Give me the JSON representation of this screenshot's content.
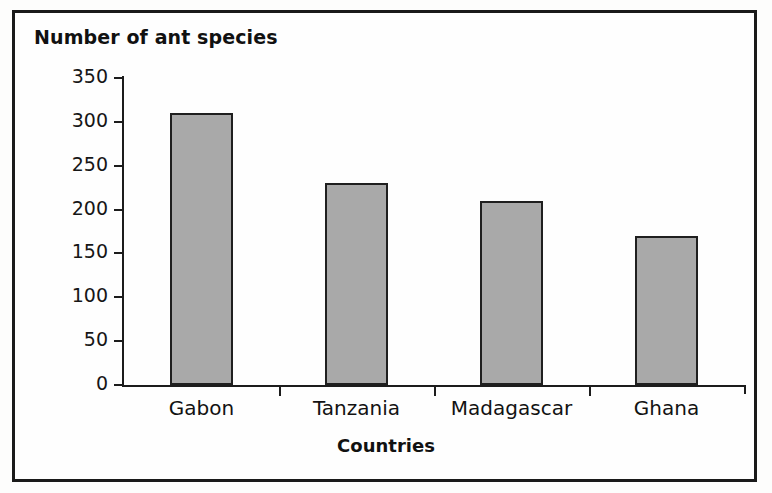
{
  "chart_data": {
    "type": "bar",
    "title": "Number of ant species",
    "xlabel": "Countries",
    "ylabel": "Number of ant species",
    "categories": [
      "Gabon",
      "Tanzania",
      "Madagascar",
      "Ghana"
    ],
    "values": [
      310,
      230,
      210,
      170
    ],
    "ylim": [
      0,
      350
    ],
    "ytick_labels": [
      "350",
      "300",
      "250",
      "200",
      "150",
      "100",
      "50",
      "0"
    ],
    "ytick_values": [
      350,
      300,
      250,
      200,
      150,
      100,
      50,
      0
    ],
    "ytick_step": 50,
    "grid": false,
    "legend": "none",
    "series": [
      {
        "name": "Number of ant species",
        "values": [
          310,
          230,
          210,
          170
        ]
      }
    ],
    "bar_fill_color": "#a9a9a9",
    "bar_border_color": "#1f1f1f",
    "axis_color": "#1c1c1c",
    "frame_color": "#1a1a1a",
    "background_color": "#fefefe"
  }
}
